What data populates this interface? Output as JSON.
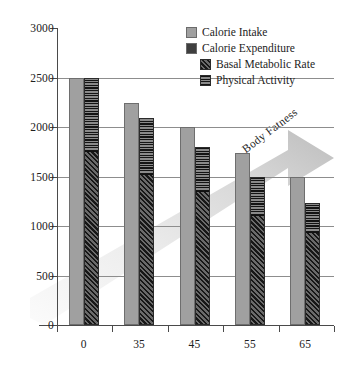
{
  "chart_data": {
    "type": "bar",
    "title": "",
    "subtitle": "",
    "xlabel": "",
    "ylabel": "",
    "categories": [
      "0",
      "35",
      "45",
      "55",
      "65"
    ],
    "ylim": [
      0,
      3000
    ],
    "y_ticks": [
      0,
      500,
      1000,
      1500,
      2000,
      2500,
      3000
    ],
    "y_tick_labels": [
      "0",
      "500",
      "1000",
      "1500",
      "2000",
      "2500",
      "3000"
    ],
    "grid": true,
    "legend_position": "top-right",
    "series": [
      {
        "name": "Calorie Intake",
        "style": "solid-light-gray",
        "values": [
          2500,
          2240,
          2000,
          1740,
          1500
        ]
      },
      {
        "name": "Calorie Expenditure",
        "style": "stacked-total",
        "values": [
          2500,
          2090,
          1800,
          1500,
          1230
        ]
      },
      {
        "name": "Basal Metabolic Rate",
        "style": "diagonal-hatch",
        "stack_of": "Calorie Expenditure",
        "values": [
          1750,
          1520,
          1350,
          1110,
          930
        ]
      },
      {
        "name": "Physical Activity",
        "style": "checker-hatch",
        "stack_of": "Calorie Expenditure",
        "values": [
          750,
          570,
          450,
          390,
          300
        ]
      }
    ],
    "annotations": [
      {
        "text": "Body Fatness",
        "type": "gradient-arrow",
        "direction": "up-right",
        "rotation_deg": -37
      }
    ]
  },
  "legend": {
    "entries": [
      {
        "label": "Calorie Intake",
        "swatch": "solid-light-gray-swatch",
        "indent": false
      },
      {
        "label": "Calorie Expenditure",
        "swatch": "solid-dark-gray-swatch",
        "indent": false
      },
      {
        "label": "Basal Metabolic Rate",
        "swatch": "diagonal-hatch-swatch",
        "indent": true
      },
      {
        "label": "Physical Activity",
        "swatch": "checker-hatch-swatch",
        "indent": true
      }
    ]
  },
  "annotation": {
    "body_fatness_label": "Body Fatness"
  },
  "colors": {
    "intake_fill": "#a0a0a0",
    "intake_stroke": "#6e6e6e",
    "bmr_fill": "#4b4b4b",
    "pa_fill": "#141414",
    "grid": "#8d8d8d",
    "axis": "#4a4a4a",
    "text": "#1c1c1c",
    "arrow_light": "#efefef",
    "arrow_dark": "#c4c4c4",
    "background": "#ffffff"
  }
}
